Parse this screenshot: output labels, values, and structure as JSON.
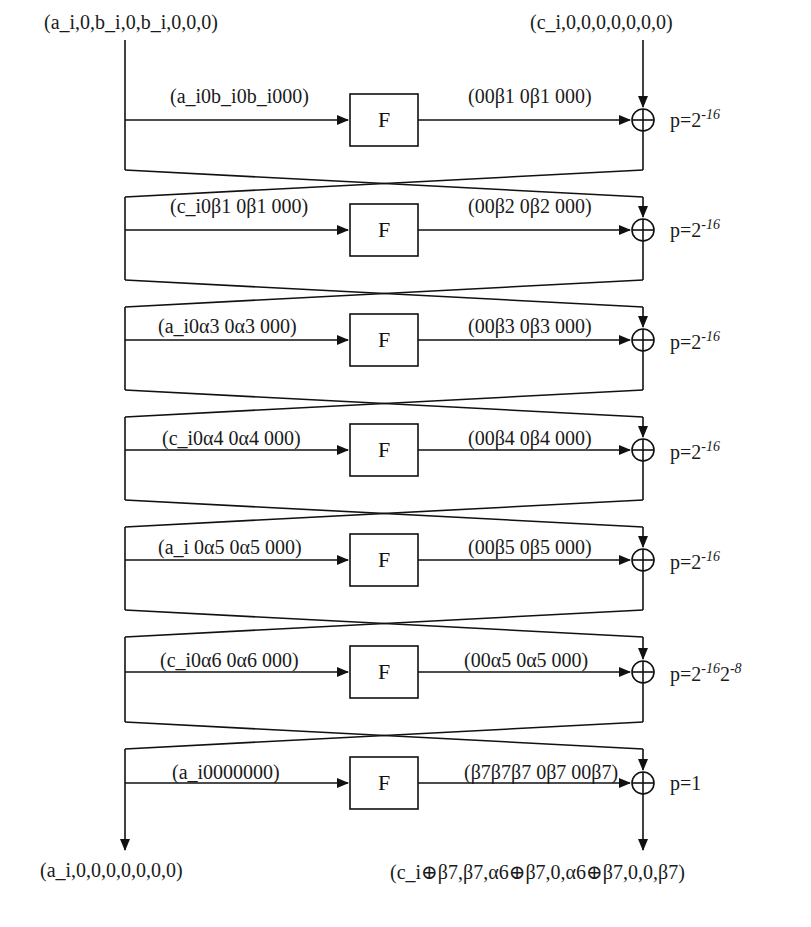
{
  "diagram": {
    "inputs": {
      "left": "(a_i,0,b_i,0,b_i,0,0,0)",
      "right": "(c_i,0,0,0,0,0,0,0)"
    },
    "outputs": {
      "left": "(a_i,0,0,0,0,0,0,0)",
      "right": "(c_i⊕β7,β7,α6⊕β7,0,α6⊕β7,0,0,β7)"
    },
    "f_label": "F",
    "rounds": [
      {
        "round": 1,
        "f_in": "(a_i0b_i0b_i000)",
        "f_out": "(00β1 0β1 000)",
        "prob": "p=2",
        "prob_exp": "-16",
        "prob_exp2": ""
      },
      {
        "round": 2,
        "f_in": "(c_i0β1 0β1 000)",
        "f_out": "(00β2 0β2 000)",
        "prob": "p=2",
        "prob_exp": "-16",
        "prob_exp2": ""
      },
      {
        "round": 3,
        "f_in": "(a_i0α3 0α3 000)",
        "f_out": "(00β3 0β3 000)",
        "prob": "p=2",
        "prob_exp": "-16",
        "prob_exp2": ""
      },
      {
        "round": 4,
        "f_in": "(c_i0α4 0α4 000)",
        "f_out": "(00β4 0β4 000)",
        "prob": "p=2",
        "prob_exp": "-16",
        "prob_exp2": ""
      },
      {
        "round": 5,
        "f_in": "(a_i 0α5 0α5 000)",
        "f_out": "(00β5 0β5 000)",
        "prob": "p=2",
        "prob_exp": "-16",
        "prob_exp2": ""
      },
      {
        "round": 6,
        "f_in": "(c_i0α6 0α6 000)",
        "f_out": "(00α5 0α5 000)",
        "prob": "p=2",
        "prob_exp": "-16",
        "prob_exp2": "2",
        "prob_exp3": "-8"
      },
      {
        "round": 7,
        "f_in": "(a_i0000000)",
        "f_out": "(β7β7β7 0β7 00β7)",
        "prob": "p=1",
        "prob_exp": "",
        "prob_exp2": ""
      }
    ]
  }
}
